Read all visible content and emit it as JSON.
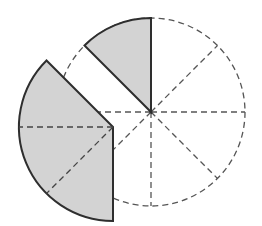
{
  "diagram": {
    "type": "circle-sector-rearrangement",
    "circle": {
      "cx": 151,
      "cy": 112,
      "r": 94,
      "sectors": 8
    },
    "displaced_piece": {
      "cx": 113,
      "cy": 127,
      "r": 94,
      "start_deg": 135,
      "end_deg": 270,
      "sectors": 3
    },
    "shaded_sector": {
      "start_deg": 90,
      "end_deg": 135
    },
    "colors": {
      "fill": "#d3d3d3",
      "stroke": "#2e2e2e",
      "dashed": "#555555",
      "background": "#ffffff"
    }
  }
}
